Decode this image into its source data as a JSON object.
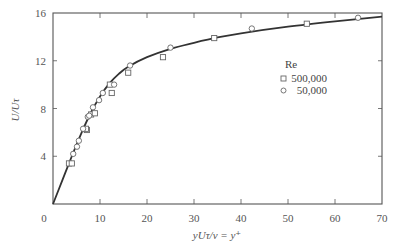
{
  "chart_data": {
    "type": "scatter",
    "title": "",
    "xlabel": "yUτ/ν = y+",
    "ylabel": "U/Uτ",
    "xlim": [
      0,
      70
    ],
    "ylim": [
      0,
      16
    ],
    "x_ticks": [
      0,
      10,
      20,
      30,
      40,
      50,
      60,
      70
    ],
    "y_ticks": [
      4,
      8,
      12,
      16
    ],
    "grid": false,
    "legend": {
      "title": "Re",
      "position": "center-right",
      "entries": [
        {
          "label": "500,000",
          "marker": "square"
        },
        {
          "label": "50,000",
          "marker": "circle"
        }
      ]
    },
    "series": [
      {
        "name": "500,000",
        "marker": "square",
        "x": [
          3.4,
          4.0,
          7.2,
          7.0,
          8.1,
          8.9,
          12.1,
          12.5,
          16.0,
          23.4,
          34.3,
          54.0
        ],
        "y": [
          3.4,
          3.4,
          6.2,
          6.3,
          7.5,
          7.6,
          10.0,
          9.3,
          11.0,
          12.3,
          13.9,
          15.1
        ]
      },
      {
        "name": "50,000",
        "marker": "circle",
        "x": [
          4.3,
          5.1,
          5.5,
          6.4,
          7.4,
          7.7,
          8.5,
          9.8,
          10.6,
          13.0,
          16.4,
          25.0,
          42.3,
          64.9
        ],
        "y": [
          4.2,
          4.8,
          5.3,
          6.3,
          7.3,
          7.4,
          8.1,
          8.7,
          9.3,
          10.0,
          11.6,
          13.1,
          14.7,
          15.6
        ]
      },
      {
        "name": "theory-curve",
        "type": "line",
        "x": [
          0,
          2,
          4,
          6,
          8,
          10,
          12,
          14,
          16,
          20,
          25,
          30,
          35,
          40,
          50,
          60,
          70
        ],
        "y": [
          0,
          2.0,
          4.0,
          5.9,
          7.6,
          9.0,
          10.1,
          10.9,
          11.5,
          12.3,
          13.0,
          13.5,
          13.95,
          14.3,
          14.85,
          15.3,
          15.7
        ]
      }
    ]
  },
  "axes": {
    "origin_label": "0",
    "x_tick_labels": [
      "10",
      "20",
      "30",
      "40",
      "50",
      "60",
      "70"
    ],
    "y_tick_labels": [
      "4",
      "8",
      "12",
      "16"
    ],
    "xlabel": "yUτ/ν = y⁺",
    "ylabel": "U/Uτ"
  },
  "legend": {
    "title": "Re",
    "items": [
      {
        "label": "500,000"
      },
      {
        "label": "50,000"
      }
    ]
  },
  "colors": {
    "axis": "#555555",
    "curve": "#333333",
    "marker": "#666666"
  }
}
